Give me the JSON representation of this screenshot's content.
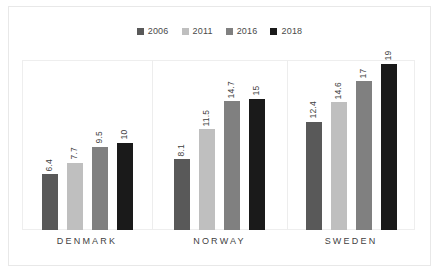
{
  "chart_data": {
    "type": "bar",
    "title": "",
    "subtitle": "",
    "xlabel": "",
    "ylabel": "",
    "categories": [
      "DENMARK",
      "NORWAY",
      "SWEDEN"
    ],
    "series": [
      {
        "name": "2006",
        "color": "#595959",
        "values": [
          6.4,
          8.1,
          12.4
        ]
      },
      {
        "name": "2011",
        "color": "#bfbfbf",
        "values": [
          7.7,
          11.5,
          14.6
        ]
      },
      {
        "name": "2016",
        "color": "#808080",
        "values": [
          9.5,
          14.7,
          17
        ]
      },
      {
        "name": "2018",
        "color": "#1a1a1a",
        "values": [
          10,
          15,
          19
        ]
      }
    ],
    "data_labels": [
      [
        "6.4",
        "7.7",
        "9.5",
        "10"
      ],
      [
        "8.1",
        "11.5",
        "14.7",
        "15"
      ],
      [
        "12.4",
        "14.6",
        "17",
        "19"
      ]
    ],
    "ylim": [
      0,
      19.2
    ],
    "grid": false,
    "legend_position": "top-center",
    "data_label_rotation": -90,
    "axis_visible": false,
    "frame_color": "#eeeeee",
    "border_color": "#e8e8e8",
    "text_color": "#3f3f3f"
  },
  "legend": {
    "items": [
      {
        "label": "2006",
        "color": "#595959"
      },
      {
        "label": "2011",
        "color": "#bfbfbf"
      },
      {
        "label": "2016",
        "color": "#808080"
      },
      {
        "label": "2018",
        "color": "#1a1a1a"
      }
    ]
  }
}
